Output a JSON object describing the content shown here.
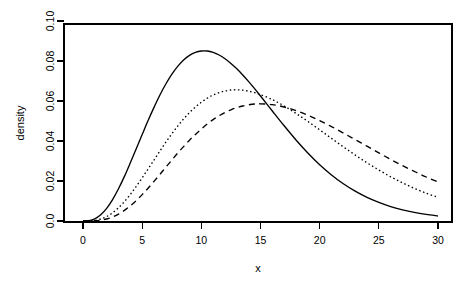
{
  "chart_data": {
    "type": "line",
    "title": "",
    "subtitle": "",
    "xlabel": "x",
    "ylabel": "density",
    "xlim": [
      0,
      30
    ],
    "ylim": [
      0,
      0.1
    ],
    "grid": false,
    "legend": "none",
    "background_color": "#ffffff",
    "line_color": "#000000",
    "xticks": [
      0,
      5,
      10,
      15,
      20,
      25,
      30
    ],
    "xtick_labels": [
      "0",
      "5",
      "10",
      "15",
      "20",
      "25",
      "30"
    ],
    "yticks": [
      0.0,
      0.02,
      0.04,
      0.06,
      0.08,
      0.1
    ],
    "ytick_labels": [
      "0.0",
      "0.02",
      "0.04",
      "0.06",
      "0.08",
      "0.10"
    ],
    "x": [
      0,
      0.5,
      1,
      1.5,
      2,
      2.5,
      3,
      3.5,
      4,
      4.5,
      5,
      5.5,
      6,
      6.5,
      7,
      7.5,
      8,
      8.5,
      9,
      9.5,
      10,
      10.5,
      11,
      11.5,
      12,
      12.5,
      13,
      13.5,
      14,
      14.5,
      15,
      16,
      17,
      18,
      19,
      20,
      21,
      22,
      23,
      24,
      25,
      26,
      27,
      28,
      29,
      30
    ],
    "series": [
      {
        "name": "curve-1",
        "style": "solid",
        "peak_x": 7.4,
        "peak_y": 0.098,
        "values": [
          0.0,
          0.0002,
          0.0011,
          0.0031,
          0.0063,
          0.0107,
          0.0161,
          0.0223,
          0.0291,
          0.0361,
          0.0432,
          0.0502,
          0.0568,
          0.063,
          0.0685,
          0.0733,
          0.0773,
          0.0805,
          0.0828,
          0.0843,
          0.085,
          0.085,
          0.0843,
          0.083,
          0.0811,
          0.0788,
          0.0761,
          0.073,
          0.0697,
          0.0662,
          0.0625,
          0.055,
          0.0476,
          0.0405,
          0.034,
          0.0281,
          0.023,
          0.0186,
          0.0149,
          0.0118,
          0.0093,
          0.0072,
          0.0056,
          0.0043,
          0.0033,
          0.0025
        ]
      },
      {
        "name": "curve-2",
        "style": "dotted",
        "peak_x": 9.3,
        "peak_y": 0.082,
        "values": [
          0.0,
          5e-05,
          0.0003,
          0.001,
          0.0022,
          0.0041,
          0.0066,
          0.0097,
          0.0133,
          0.0173,
          0.0216,
          0.026,
          0.0305,
          0.035,
          0.0394,
          0.0435,
          0.0474,
          0.051,
          0.0542,
          0.057,
          0.0594,
          0.0614,
          0.063,
          0.0642,
          0.065,
          0.0655,
          0.0656,
          0.0654,
          0.0649,
          0.0642,
          0.0632,
          0.0607,
          0.0575,
          0.0538,
          0.0498,
          0.0456,
          0.0413,
          0.0371,
          0.033,
          0.0291,
          0.0255,
          0.0221,
          0.0191,
          0.0163,
          0.0139,
          0.0118
        ]
      },
      {
        "name": "curve-3",
        "style": "dashed",
        "peak_x": 11.0,
        "peak_y": 0.073,
        "values": [
          0.0,
          2e-05,
          0.00012,
          0.0004,
          0.001,
          0.002,
          0.0034,
          0.0053,
          0.0076,
          0.0102,
          0.0132,
          0.0164,
          0.0198,
          0.0233,
          0.0269,
          0.0304,
          0.0339,
          0.0372,
          0.0404,
          0.0433,
          0.046,
          0.0485,
          0.0507,
          0.0526,
          0.0543,
          0.0556,
          0.0567,
          0.0575,
          0.0581,
          0.0585,
          0.0586,
          0.0582,
          0.057,
          0.0552,
          0.0529,
          0.0502,
          0.0472,
          0.044,
          0.0407,
          0.0374,
          0.0341,
          0.0308,
          0.0277,
          0.0248,
          0.022,
          0.0195
        ]
      }
    ]
  }
}
